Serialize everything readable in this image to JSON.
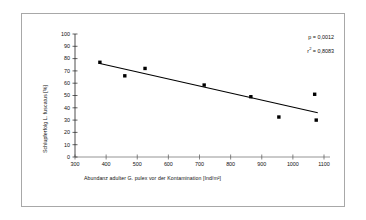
{
  "chart_data": {
    "type": "scatter",
    "title": "",
    "xlabel": "Abundanz adulter G. pulex vor der Kontamination [Ind/m²]",
    "ylabel": "Schlupferfolg L. fuscatus [%]",
    "xlim": [
      300,
      1100
    ],
    "ylim": [
      0,
      100
    ],
    "xticks": [
      300,
      400,
      500,
      600,
      700,
      800,
      900,
      1000,
      1100
    ],
    "yticks": [
      0,
      10,
      20,
      30,
      40,
      50,
      60,
      70,
      80,
      90,
      100
    ],
    "grid": false,
    "legend": "none",
    "marker": "filled-square",
    "marker_color": "#000000",
    "points": [
      {
        "x": 380,
        "y": 77
      },
      {
        "x": 460,
        "y": 66
      },
      {
        "x": 525,
        "y": 72
      },
      {
        "x": 715,
        "y": 58.5
      },
      {
        "x": 865,
        "y": 49
      },
      {
        "x": 955,
        "y": 32.5
      },
      {
        "x": 1070,
        "y": 51
      },
      {
        "x": 1075,
        "y": 30
      }
    ],
    "trendline": {
      "type": "linear",
      "x_start": 380,
      "y_start": 76,
      "x_end": 1080,
      "y_end": 36,
      "color": "#000000"
    },
    "annotations": [
      {
        "text": "p = 0,0012"
      },
      {
        "text": "r",
        "sup": "2",
        "tail": " = 0,8083"
      }
    ]
  },
  "annotation_p": "p = 0,0012",
  "annotation_r_prefix": "r",
  "annotation_r_sup": "2",
  "annotation_r_tail": " = 0,8083",
  "axis": {
    "x_title": "Abundanz adulter G. pulex vor der Kontamination [Ind/m²]",
    "y_title": "Schlupferfolg L. fuscatus [%]"
  }
}
